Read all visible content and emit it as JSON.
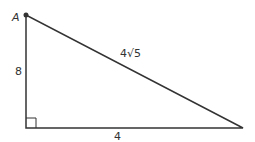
{
  "figure": {
    "type": "right-triangle",
    "vertex_label": "A",
    "legs": {
      "vertical": "8",
      "horizontal": "4"
    },
    "hypotenuse": "4√5",
    "colors": {
      "stroke": "#333333",
      "background": "#ffffff"
    }
  }
}
